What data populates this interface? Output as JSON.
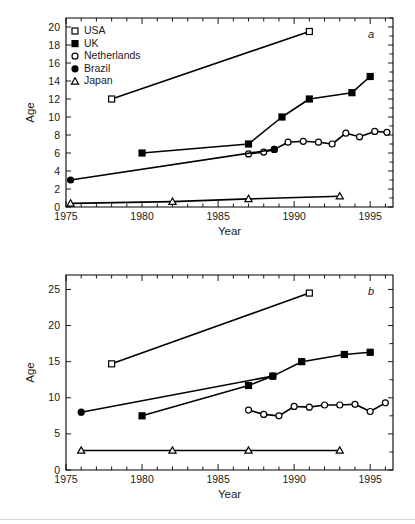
{
  "figure": {
    "background": "#ffffff",
    "line_color": "#000000",
    "text_color": "#1a1a1a"
  },
  "legend": {
    "position": "top-left-inside-panel-a",
    "entries": [
      {
        "label": "USA",
        "marker": "open-square"
      },
      {
        "label": "UK",
        "marker": "filled-square"
      },
      {
        "label": "Netherlands",
        "marker": "open-circle"
      },
      {
        "label": "Brazil",
        "marker": "filled-circle"
      },
      {
        "label": "Japan",
        "marker": "open-triangle"
      }
    ]
  },
  "chart_data": [
    {
      "type": "line",
      "panel": "a",
      "panel_label": "a",
      "title": "",
      "xlabel": "Year",
      "ylabel": "Age",
      "xlim": [
        1975,
        1996.5
      ],
      "ylim": [
        0,
        21
      ],
      "xticks": [
        1975,
        1980,
        1985,
        1990,
        1995
      ],
      "xticklabels": [
        "1975",
        "1980",
        "1985",
        "1990",
        "1995"
      ],
      "xminor_step": 1,
      "yticks": [
        0,
        2,
        4,
        6,
        8,
        10,
        12,
        14,
        16,
        18,
        20
      ],
      "yticklabels": [
        "0",
        "2",
        "4",
        "6",
        "8",
        "10",
        "12",
        "14",
        "16",
        "18",
        "20"
      ],
      "grid": false,
      "legend_position": "upper left",
      "series": [
        {
          "name": "USA",
          "marker": "open-square",
          "x": [
            1978.0,
            1991.0
          ],
          "y": [
            12.0,
            19.5
          ]
        },
        {
          "name": "UK",
          "marker": "filled-square",
          "x": [
            1980.0,
            1987.0,
            1989.2,
            1991.0,
            1993.8,
            1995.0
          ],
          "y": [
            6.0,
            7.0,
            10.0,
            12.0,
            12.7,
            14.5
          ]
        },
        {
          "name": "Netherlands",
          "marker": "open-circle",
          "x": [
            1987.0,
            1988.0,
            1988.7,
            1989.6,
            1990.6,
            1991.6,
            1992.5,
            1993.4,
            1994.3,
            1995.3,
            1996.1
          ],
          "y": [
            5.9,
            6.1,
            6.4,
            7.2,
            7.3,
            7.2,
            7.0,
            8.2,
            7.8,
            8.4,
            8.3
          ]
        },
        {
          "name": "Brazil",
          "marker": "filled-circle",
          "x": [
            1975.3,
            1988.7
          ],
          "y": [
            3.0,
            6.4
          ]
        },
        {
          "name": "Japan",
          "marker": "open-triangle",
          "x": [
            1975.3,
            1982.0,
            1987.0,
            1993.0
          ],
          "y": [
            0.4,
            0.6,
            0.9,
            1.2
          ]
        }
      ]
    },
    {
      "type": "line",
      "panel": "b",
      "panel_label": "b",
      "title": "",
      "xlabel": "Year",
      "ylabel": "Age",
      "xlim": [
        1975,
        1996.5
      ],
      "ylim": [
        0,
        27
      ],
      "xticks": [
        1975,
        1980,
        1985,
        1990,
        1995
      ],
      "xticklabels": [
        "1975",
        "1980",
        "1985",
        "1990",
        "1995"
      ],
      "xminor_step": 1,
      "yticks": [
        0,
        5,
        10,
        15,
        20,
        25
      ],
      "yticklabels": [
        "0",
        "5",
        "10",
        "15",
        "20",
        "25"
      ],
      "grid": false,
      "legend_position": "none",
      "series": [
        {
          "name": "USA",
          "marker": "open-square",
          "x": [
            1978.0,
            1991.0
          ],
          "y": [
            14.7,
            24.5
          ]
        },
        {
          "name": "UK",
          "marker": "filled-square",
          "x": [
            1980.0,
            1987.0,
            1988.6,
            1990.5,
            1993.3,
            1995.0
          ],
          "y": [
            7.5,
            11.7,
            13.0,
            15.0,
            16.0,
            16.3
          ]
        },
        {
          "name": "Netherlands",
          "marker": "open-circle",
          "x": [
            1987.0,
            1988.0,
            1989.0,
            1990.0,
            1991.0,
            1992.0,
            1993.0,
            1994.0,
            1995.0,
            1996.0
          ],
          "y": [
            8.3,
            7.7,
            7.5,
            8.8,
            8.7,
            9.0,
            9.0,
            9.1,
            8.1,
            9.3
          ]
        },
        {
          "name": "Brazil",
          "marker": "filled-circle",
          "x": [
            1976.0,
            1988.6
          ],
          "y": [
            8.0,
            13.0
          ]
        },
        {
          "name": "Japan",
          "marker": "open-triangle",
          "x": [
            1976.0,
            1982.0,
            1987.0,
            1993.0
          ],
          "y": [
            2.7,
            2.7,
            2.7,
            2.7
          ]
        }
      ]
    }
  ]
}
